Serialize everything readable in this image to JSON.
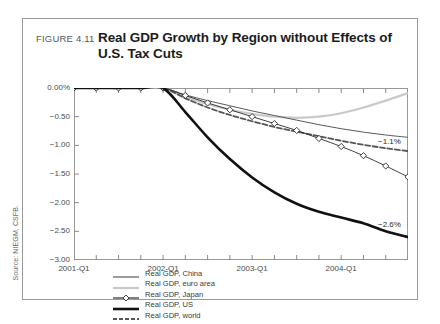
{
  "figure": {
    "number": "FIGURE 4.11",
    "title": "Real GDP Growth by Region without Effects of U.S. Tax Cuts",
    "title_line1": "Real GDP Growth by Region without Effects of",
    "title_line2": "U.S. Tax Cuts",
    "source": "Source: NIEGM, CSFB."
  },
  "chart_data": {
    "type": "line",
    "title": "Real GDP Growth by Region without Effects of U.S. Tax Cuts",
    "xlabel": "",
    "ylabel": "",
    "ylim": [
      -3.0,
      0.0
    ],
    "ytick_labels": [
      "0.00%",
      "-0.50",
      "-1.00",
      "-1.50",
      "-2.00",
      "-2.50",
      "-3.00"
    ],
    "ytick_values": [
      0.0,
      -0.5,
      -1.0,
      -1.5,
      -2.0,
      -2.5,
      -3.0
    ],
    "xtick_labels": [
      "2001-Q1",
      "2002-Q1",
      "2003-Q1",
      "2004-Q1"
    ],
    "x": [
      "2001-Q1",
      "2001-Q2",
      "2001-Q3",
      "2001-Q4",
      "2002-Q1",
      "2002-Q2",
      "2002-Q3",
      "2002-Q4",
      "2003-Q1",
      "2003-Q2",
      "2003-Q3",
      "2003-Q4",
      "2004-Q1",
      "2004-Q2",
      "2004-Q3",
      "2004-Q4"
    ],
    "grid": false,
    "legend_position": "lower-left-inside",
    "series": [
      {
        "name": "Real GDP, China",
        "color": "#5a5a5a",
        "style": "solid",
        "width": 1.0,
        "marker": "none",
        "values": [
          0.0,
          0.0,
          0.0,
          0.0,
          0.0,
          -0.12,
          -0.22,
          -0.31,
          -0.4,
          -0.48,
          -0.56,
          -0.64,
          -0.71,
          -0.77,
          -0.82,
          -0.86
        ]
      },
      {
        "name": "Real GDP, euro area",
        "color": "#c9c9c9",
        "style": "solid",
        "width": 2.2,
        "marker": "none",
        "values": [
          0.0,
          0.0,
          0.0,
          0.0,
          0.0,
          -0.15,
          -0.28,
          -0.38,
          -0.45,
          -0.5,
          -0.52,
          -0.5,
          -0.44,
          -0.34,
          -0.22,
          -0.09
        ]
      },
      {
        "name": "Real GDP, Japan",
        "color": "#2a2a2a",
        "style": "solid",
        "width": 0.9,
        "marker": "diamond",
        "values": [
          0.0,
          0.0,
          0.0,
          0.0,
          0.0,
          -0.13,
          -0.26,
          -0.38,
          -0.5,
          -0.62,
          -0.74,
          -0.88,
          -1.02,
          -1.18,
          -1.36,
          -1.55
        ]
      },
      {
        "name": "Real GDP, US",
        "color": "#111111",
        "style": "solid",
        "width": 2.6,
        "marker": "none",
        "values": [
          0.0,
          0.0,
          0.0,
          0.0,
          0.0,
          -0.42,
          -0.86,
          -1.24,
          -1.56,
          -1.82,
          -2.02,
          -2.16,
          -2.26,
          -2.36,
          -2.5,
          -2.6
        ]
      },
      {
        "name": "Real GDP, world",
        "color": "#555555",
        "style": "dashed",
        "width": 1.8,
        "marker": "none",
        "values": [
          0.0,
          0.0,
          0.0,
          0.0,
          0.0,
          -0.18,
          -0.34,
          -0.47,
          -0.58,
          -0.68,
          -0.76,
          -0.84,
          -0.92,
          -0.99,
          -1.05,
          -1.1
        ]
      }
    ],
    "annotations": [
      {
        "text": "-1.1%",
        "series": "Real GDP, world",
        "value": -1.1
      },
      {
        "text": "-2.6%",
        "series": "Real GDP, US",
        "value": -2.6
      }
    ]
  }
}
